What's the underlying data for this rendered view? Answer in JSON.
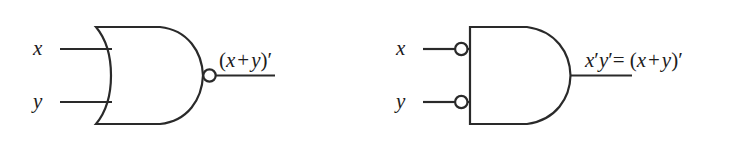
{
  "figure": {
    "background_color": "#ffffff",
    "line_color": "#2a2a2a",
    "text_color": "#1c1c1c"
  },
  "gates": [
    {
      "id": "nor-gate",
      "name": "nor-gate",
      "shape": "or-gate-body-with-output-bubble",
      "inputs": [
        {
          "name": "input-x",
          "label": "x",
          "inverted": false
        },
        {
          "name": "input-y",
          "label": "y",
          "inverted": false
        }
      ],
      "output": {
        "name": "output-nor",
        "inverted": true,
        "expression_parts": {
          "open_paren": "(",
          "left_operand": "x",
          "operator": "+",
          "right_operand": "y",
          "close_paren": ")",
          "prime": "′"
        },
        "expression_text": "(x + y)′"
      }
    },
    {
      "id": "negative-and-gate",
      "name": "negative-and-gate",
      "shape": "and-gate-body-with-input-bubbles",
      "inputs": [
        {
          "name": "input-x",
          "label": "x",
          "inverted": true
        },
        {
          "name": "input-y",
          "label": "y",
          "inverted": true
        }
      ],
      "output": {
        "name": "output-negative-and",
        "inverted": false,
        "expression_parts": {
          "term_x": "x",
          "prime_x": "′",
          "term_y": "y",
          "prime_y": "′",
          "equals": "=",
          "open_paren": "(",
          "left_operand": "x",
          "operator": "+",
          "right_operand": "y",
          "close_paren": ")",
          "prime_result": "′"
        },
        "expression_text": "x′y′= (x + y)′"
      }
    }
  ]
}
